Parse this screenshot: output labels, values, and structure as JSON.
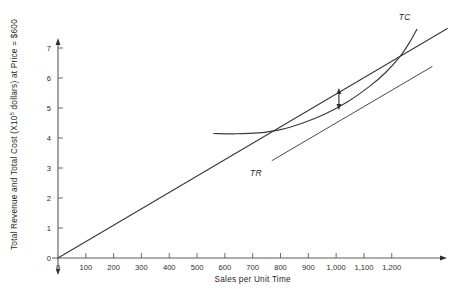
{
  "chart_data": {
    "type": "line",
    "title": "",
    "xlabel": "Sales per Unit Time",
    "ylabel_parts": {
      "pre": "Total Revenue and Total Cost (X10",
      "sup": "5",
      "post": " dollars) at Price = $600"
    },
    "ylabel": "Total Revenue and Total Cost (X10^5 dollars) at Price = $600",
    "xlim": [
      0,
      1400
    ],
    "ylim": [
      0,
      7.7
    ],
    "grid": false,
    "legend": "inline-labels",
    "xticks": [
      0,
      100,
      200,
      300,
      400,
      500,
      600,
      700,
      800,
      900,
      1000,
      1100,
      1200
    ],
    "xticklabels": [
      "0",
      "100",
      "200",
      "300",
      "400",
      "500",
      "600",
      "700",
      "800",
      "900",
      "1,000",
      "1,100",
      "1,200"
    ],
    "yticks": [
      0,
      1,
      2,
      3,
      4,
      5,
      6,
      7
    ],
    "yticklabels": [
      "0",
      "1",
      "2",
      "3",
      "4",
      "5",
      "6",
      "7"
    ],
    "series": [
      {
        "name": "TR",
        "label": "TR",
        "type": "line",
        "style": "straight",
        "label_x": 690,
        "label_y": 2.72,
        "points": [
          {
            "x": 0,
            "y": 0.0
          },
          {
            "x": 1400,
            "y": 7.65
          }
        ]
      },
      {
        "name": "TC",
        "label": "TC",
        "type": "curve",
        "style": "cubic",
        "label_x": 1225,
        "label_y": 7.95,
        "points": [
          {
            "x": 560,
            "y": 4.15
          },
          {
            "x": 640,
            "y": 4.14
          },
          {
            "x": 720,
            "y": 4.17
          },
          {
            "x": 800,
            "y": 4.28
          },
          {
            "x": 880,
            "y": 4.5
          },
          {
            "x": 960,
            "y": 4.8
          },
          {
            "x": 1040,
            "y": 5.2
          },
          {
            "x": 1120,
            "y": 5.72
          },
          {
            "x": 1180,
            "y": 6.2
          },
          {
            "x": 1230,
            "y": 6.72
          },
          {
            "x": 1265,
            "y": 7.2
          },
          {
            "x": 1290,
            "y": 7.62
          }
        ]
      },
      {
        "name": "tangent",
        "label": "",
        "type": "line",
        "style": "straight-segment",
        "points": [
          {
            "x": 770,
            "y": 3.25
          },
          {
            "x": 1345,
            "y": 6.38
          }
        ]
      }
    ],
    "annotations": [
      {
        "name": "max-profit-gap",
        "type": "double-arrow-vertical",
        "x": 1010,
        "y_top": 5.67,
        "y_bottom": 4.93,
        "text": ""
      }
    ]
  },
  "labels": {
    "tr": "TR",
    "tc": "TC"
  }
}
